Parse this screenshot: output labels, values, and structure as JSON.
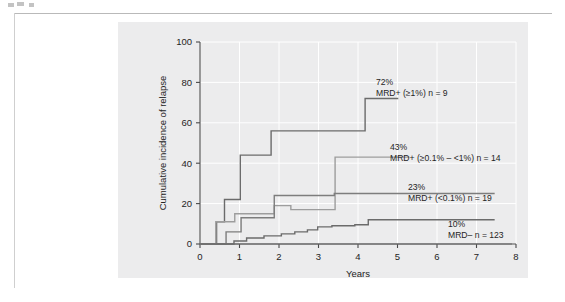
{
  "chart_data": {
    "type": "line",
    "title": "",
    "xlabel": "Years",
    "ylabel": "Cumulative incidence of relapse",
    "xlim": [
      0,
      8
    ],
    "ylim": [
      0,
      100
    ],
    "xticks": [
      "0",
      "1",
      "2",
      "3",
      "4",
      "5",
      "6",
      "7",
      "8"
    ],
    "yticks": [
      "0",
      "20",
      "40",
      "60",
      "80",
      "100"
    ],
    "grid": true,
    "legend_position": "inline-annotations",
    "step_style": "post",
    "series": [
      {
        "name": "MRD+ (≥1%) n = 9",
        "group_label": "MRD+ (≥1%)",
        "n": 9,
        "final_value_label": "72%",
        "final_value": 72,
        "color": "#6b6b6b",
        "annotation_value": "72%",
        "annotation_label": "MRD+ (≥1%) n = 9",
        "points": [
          [
            0.0,
            0
          ],
          [
            0.42,
            0
          ],
          [
            0.42,
            11
          ],
          [
            0.62,
            11
          ],
          [
            0.62,
            22
          ],
          [
            1.02,
            22
          ],
          [
            1.02,
            44
          ],
          [
            1.8,
            44
          ],
          [
            1.8,
            56
          ],
          [
            4.18,
            56
          ],
          [
            4.18,
            72
          ],
          [
            5.02,
            72
          ]
        ]
      },
      {
        "name": "MRD+ (≥0.1% – <1%) n = 14",
        "group_label": "MRD+ (≥0.1% – <1%)",
        "n": 14,
        "final_value_label": "43%",
        "final_value": 43,
        "color": "#9d9d9d",
        "annotation_value": "43%",
        "annotation_label": "MRD+ (≥0.1% – <1%) n = 14",
        "points": [
          [
            0.0,
            0
          ],
          [
            0.4,
            0
          ],
          [
            0.4,
            11
          ],
          [
            0.88,
            11
          ],
          [
            0.88,
            15
          ],
          [
            1.88,
            15
          ],
          [
            1.88,
            19
          ],
          [
            2.3,
            19
          ],
          [
            2.3,
            17
          ],
          [
            3.42,
            17
          ],
          [
            3.42,
            43
          ],
          [
            5.3,
            43
          ]
        ]
      },
      {
        "name": "MRD+ (<0.1%) n = 19",
        "group_label": "MRD+ (<0.1%)",
        "n": 19,
        "final_value_label": "23%",
        "final_value": 23,
        "color": "#7d7d7d",
        "annotation_value": "23%",
        "annotation_label": "MRD+ (<0.1%) n = 19",
        "points": [
          [
            0.0,
            0
          ],
          [
            0.66,
            0
          ],
          [
            0.66,
            6
          ],
          [
            1.04,
            6
          ],
          [
            1.04,
            13
          ],
          [
            1.88,
            13
          ],
          [
            1.88,
            24
          ],
          [
            3.4,
            24
          ],
          [
            3.4,
            25
          ],
          [
            7.46,
            25
          ]
        ]
      },
      {
        "name": "MRD– n = 123",
        "group_label": "MRD–",
        "n": 123,
        "final_value_label": "10%",
        "final_value": 10,
        "color": "#6b6b6b",
        "annotation_value": "10%",
        "annotation_label": "MRD–  n = 123",
        "points": [
          [
            0.0,
            0
          ],
          [
            0.86,
            0
          ],
          [
            0.86,
            1.5
          ],
          [
            1.18,
            1.5
          ],
          [
            1.18,
            3
          ],
          [
            1.62,
            3
          ],
          [
            1.62,
            4
          ],
          [
            2.06,
            4
          ],
          [
            2.06,
            5
          ],
          [
            2.4,
            5
          ],
          [
            2.4,
            6
          ],
          [
            2.72,
            6
          ],
          [
            2.72,
            7
          ],
          [
            2.98,
            7
          ],
          [
            2.98,
            8.5
          ],
          [
            3.34,
            8.5
          ],
          [
            3.34,
            9
          ],
          [
            3.92,
            9
          ],
          [
            3.92,
            9.5
          ],
          [
            4.26,
            9.5
          ],
          [
            4.26,
            12
          ],
          [
            7.46,
            12
          ]
        ]
      }
    ],
    "baseline": {
      "name": "x-axis-baseline",
      "points": [
        [
          0,
          0
        ],
        [
          7.9,
          0
        ]
      ]
    }
  },
  "annotations": [
    {
      "value": "72%",
      "label": "MRD+ (≥1%) n = 9"
    },
    {
      "value": "43%",
      "label": "MRD+ (≥0.1% – <1%) n = 14"
    },
    {
      "value": "23%",
      "label": "MRD+ (<0.1%) n = 19"
    },
    {
      "value": "10%",
      "label": "MRD–  n = 123"
    }
  ],
  "colors": {
    "panel_background": "#ececed",
    "page_background": "#ffffff",
    "gridline": "#ffffff",
    "axis": "#4a4a4a",
    "text": "#242424",
    "series_dark": "#6b6b6b",
    "series_light": "#9d9d9d"
  }
}
